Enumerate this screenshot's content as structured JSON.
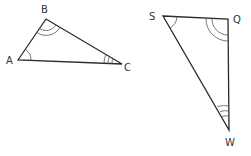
{
  "diagram": {
    "triangles": [
      {
        "name": "ABC",
        "vertices": [
          {
            "label": "A",
            "x": 18,
            "y": 60,
            "arcs": 1
          },
          {
            "label": "B",
            "x": 46,
            "y": 19,
            "arcs": 2
          },
          {
            "label": "C",
            "x": 122,
            "y": 64,
            "arcs": 3
          }
        ]
      },
      {
        "name": "SQW",
        "vertices": [
          {
            "label": "S",
            "x": 163,
            "y": 16,
            "arcs": 1
          },
          {
            "label": "Q",
            "x": 228,
            "y": 19,
            "arcs": 2
          },
          {
            "label": "W",
            "x": 229,
            "y": 130,
            "arcs": 3
          }
        ]
      }
    ],
    "labels": {
      "A": "A",
      "B": "B",
      "C": "C",
      "S": "S",
      "Q": "Q",
      "W": "W"
    },
    "colors": {
      "line": "#2a2a2a",
      "arc": "#555555",
      "text": "#333333",
      "background": "#ffffff"
    }
  }
}
